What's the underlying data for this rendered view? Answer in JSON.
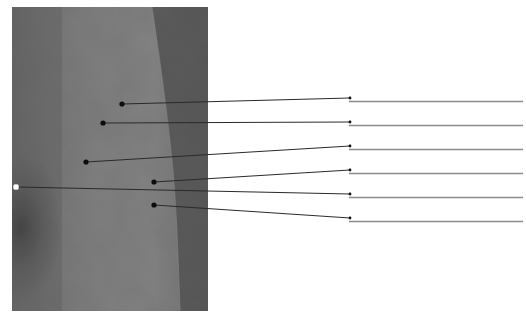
{
  "figure": {
    "type": "labeling-worksheet",
    "photo": {
      "x": 12,
      "y": 7,
      "width": 196,
      "height": 304
    },
    "colors": {
      "background": "#ffffff",
      "photo_light": "#8c8c8c",
      "photo_mid": "#767676",
      "photo_dark_strip": "#4a4a4a",
      "photo_shadow": "#2a2a2a",
      "leader_line": "#2a2a2a",
      "answer_line": "#8a8a8a",
      "dot": "#0c0c0c",
      "reference_dot": "#ffffff"
    },
    "labels": [
      {
        "id": 1,
        "text": "",
        "point": [
          122,
          104
        ],
        "end": [
          350,
          98
        ],
        "blank_y": 101.5
      },
      {
        "id": 2,
        "text": "",
        "point": [
          103,
          123
        ],
        "end": [
          350,
          122
        ],
        "blank_y": 125.5
      },
      {
        "id": 3,
        "text": "",
        "point": [
          86,
          162
        ],
        "end": [
          350,
          146
        ],
        "blank_y": 149.5
      },
      {
        "id": 4,
        "text": "",
        "point": [
          154,
          182
        ],
        "end": [
          350,
          170
        ],
        "blank_y": 173.5
      },
      {
        "id": 5,
        "text": "",
        "point": [
          16,
          187
        ],
        "end": [
          350,
          194
        ],
        "blank_y": 197.5,
        "reference_point": true
      },
      {
        "id": 6,
        "text": "",
        "point": [
          154,
          205
        ],
        "end": [
          350,
          218
        ],
        "blank_y": 221.5
      }
    ],
    "blank_line": {
      "x_start": 349,
      "x_end": 523
    }
  }
}
